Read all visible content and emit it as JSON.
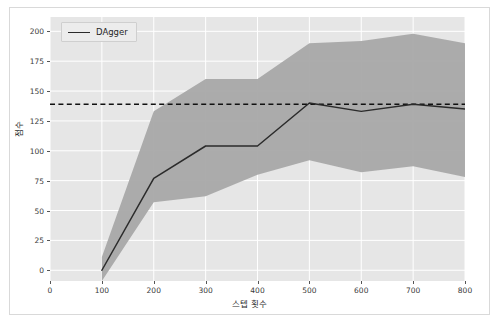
{
  "chart_data": {
    "type": "line",
    "title": "",
    "xlabel": "스텝 횟수",
    "ylabel": "점수",
    "xlim": [
      0,
      800
    ],
    "ylim": [
      -9,
      212
    ],
    "grid": true,
    "legend_position": "upper left",
    "x": [
      100,
      200,
      300,
      400,
      500,
      600,
      700,
      800
    ],
    "series": [
      {
        "name": "DAgger",
        "color": "#2b2b2b",
        "style": "solid",
        "values": [
          0,
          77,
          104,
          104,
          140,
          133,
          139,
          135
        ],
        "band_upper": [
          11,
          133,
          160,
          160,
          190,
          192,
          198,
          190
        ],
        "band_lower": [
          -9,
          57,
          62,
          80,
          92,
          82,
          87,
          78
        ],
        "band_color": "#a8a8a8"
      },
      {
        "name": "expert-threshold",
        "color": "#111111",
        "style": "dashed",
        "constant_value": 139
      }
    ],
    "xticks": [
      0,
      100,
      200,
      300,
      400,
      500,
      600,
      700,
      800
    ],
    "yticks": [
      0,
      25,
      50,
      75,
      100,
      125,
      150,
      175,
      200
    ],
    "xtick_labels": [
      "0",
      "100",
      "200",
      "300",
      "400",
      "500",
      "600",
      "700",
      "800"
    ],
    "ytick_labels": [
      "0",
      "25",
      "50",
      "75",
      "100",
      "125",
      "150",
      "175",
      "200"
    ],
    "plot_background": "#e6e6e6",
    "grid_color": "#ffffff",
    "figure_background": "#ffffff"
  },
  "legend": {
    "items": [
      {
        "label": "DAgger"
      }
    ]
  },
  "axes": {
    "x_label": "스텝 횟수",
    "y_label": "점수"
  }
}
